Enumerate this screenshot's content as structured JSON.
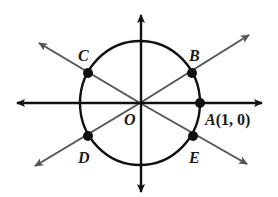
{
  "diagram": {
    "colors": {
      "axis": "#111111",
      "circle": "#111111",
      "diagonal": "#555555",
      "point": "#111111",
      "label": "#1a1a1a"
    },
    "origin": {
      "label": "O"
    },
    "points": [
      {
        "id": "A",
        "label": "A",
        "coord_text": "(1, 0)"
      },
      {
        "id": "B",
        "label": "B"
      },
      {
        "id": "C",
        "label": "C"
      },
      {
        "id": "D",
        "label": "D"
      },
      {
        "id": "E",
        "label": "E"
      }
    ]
  }
}
